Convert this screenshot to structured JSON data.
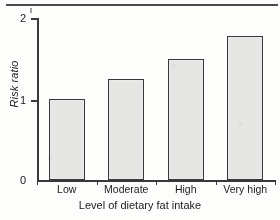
{
  "chart_data": {
    "type": "bar",
    "title": "",
    "categories": [
      "Low",
      "Moderate",
      "High",
      "Very high"
    ],
    "values": [
      1.0,
      1.25,
      1.5,
      1.78
    ],
    "series": [
      {
        "name": "Risk ratio",
        "values": [
          1.0,
          1.25,
          1.5,
          1.78
        ]
      }
    ],
    "xlabel": "Level of dietary fat intake",
    "ylabel": "Risk ratio",
    "ylim": [
      0,
      2
    ],
    "yticks": [
      0,
      1,
      2
    ],
    "ytick_labels": [
      "0",
      "1",
      "2"
    ],
    "grid": false,
    "legend": false,
    "bar_fill_color": "#e4e4e3",
    "bar_edge_color": "#3a3a3a",
    "axis_color": "#3a3a3a",
    "background_color": "#fbfbfa"
  },
  "axes": {
    "y_title": "Risk ratio",
    "x_title": "Level of dietary fat intake",
    "y_tick_labels": [
      "2",
      "1",
      "0"
    ]
  }
}
